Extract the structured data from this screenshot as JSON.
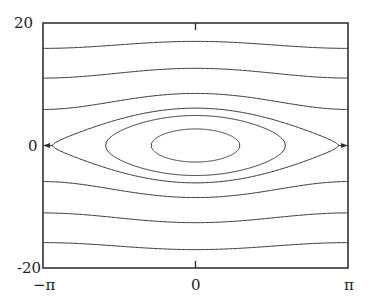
{
  "chart_data": {
    "type": "line",
    "title": "",
    "subtitle": "",
    "xlabel": "",
    "ylabel": "",
    "xlim": [
      -3.14159,
      3.14159
    ],
    "ylim": [
      -20,
      20
    ],
    "grid": false,
    "legend": null,
    "x_ticks": [
      {
        "value": -3.14159,
        "label": "−π"
      },
      {
        "value": 0,
        "label": "0"
      },
      {
        "value": 3.14159,
        "label": "π"
      }
    ],
    "y_ticks": [
      {
        "value": -20,
        "label": "-20"
      },
      {
        "value": 0,
        "label": "0"
      },
      {
        "value": 20,
        "label": "20"
      }
    ],
    "model": {
      "K": 9.4
    },
    "series": [
      {
        "name": "closed orbit inner",
        "kind": "closed",
        "v_at_0": 2.7,
        "v_at_pi": null
      },
      {
        "name": "closed orbit middle",
        "kind": "closed",
        "v_at_0": 4.9,
        "v_at_pi": null
      },
      {
        "name": "separatrix",
        "kind": "separatrix",
        "v_at_0": 6.1,
        "v_at_pi": 0
      },
      {
        "name": "open orbit 1 (upper)",
        "kind": "open",
        "v_at_0": 8.5,
        "v_at_pi": 5.9
      },
      {
        "name": "open orbit 2 (upper)",
        "kind": "open",
        "v_at_0": 12.6,
        "v_at_pi": 10.8
      },
      {
        "name": "open orbit 3 (upper)",
        "kind": "open",
        "v_at_0": 17.0,
        "v_at_pi": 15.9
      },
      {
        "name": "open orbit 1 (lower)",
        "kind": "open",
        "v_at_0": -8.5,
        "v_at_pi": -5.9
      },
      {
        "name": "open orbit 2 (lower)",
        "kind": "open",
        "v_at_0": -12.6,
        "v_at_pi": -10.8
      },
      {
        "name": "open orbit 3 (lower)",
        "kind": "open",
        "v_at_0": -17.0,
        "v_at_pi": -15.9
      }
    ]
  },
  "axes": {
    "y_top": "20",
    "y_mid": "0",
    "y_bottom": "-20",
    "x_left": "−π",
    "x_mid": "0",
    "x_right": "π"
  }
}
